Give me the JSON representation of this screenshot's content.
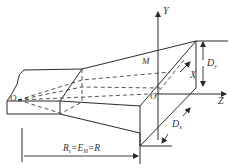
{
  "diagram": {
    "type": "engineering-3d-schematic",
    "colors": {
      "line": "#2b2b2b",
      "text": "#333333",
      "background": "#ffffff"
    },
    "axes": {
      "y_label": "Y",
      "z_label": "Z",
      "x_label": "X"
    },
    "points": {
      "origin_left": "O",
      "origin_right": "O'",
      "point_m": "M"
    },
    "dimensions": {
      "dy": {
        "main": "D",
        "sub": "y"
      },
      "dx": {
        "main": "D",
        "sub": "x"
      },
      "radius": {
        "r_s_main": "R",
        "r_s_sub": "s",
        "eq1": "=",
        "e_m_main": "E",
        "e_m_sub": "M",
        "eq2": "=",
        "r_main": "R"
      }
    }
  }
}
